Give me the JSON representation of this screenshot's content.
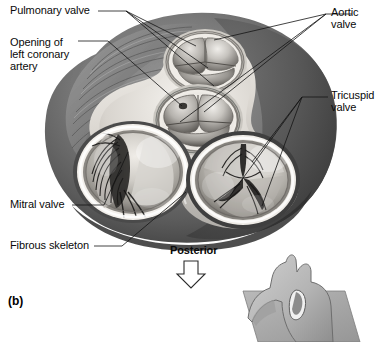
{
  "figure": {
    "panel_letter": "(b)",
    "view_description": "Superior view of the heart valves and fibrous skeleton with atria removed"
  },
  "labels": {
    "pulmonary_valve": "Pulmonary valve",
    "opening_left_coronary_line1": "Opening of",
    "opening_left_coronary_line2": "left coronary",
    "opening_left_coronary_line3": "artery",
    "aortic_valve_line1": "Aortic",
    "aortic_valve_line2": "valve",
    "tricuspid_valve_line1": "Tricuspid",
    "tricuspid_valve_line2": "valve",
    "mitral_valve": "Mitral valve",
    "fibrous_skeleton": "Fibrous skeleton",
    "posterior": "Posterior"
  },
  "structures": {
    "pulmonary_valve": {
      "name": "Pulmonary valve",
      "cusp_count": 3,
      "position": "superior-center"
    },
    "aortic_valve": {
      "name": "Aortic valve",
      "cusp_count": 3,
      "position": "center"
    },
    "mitral_valve": {
      "name": "Mitral valve",
      "cusp_count": 2,
      "alias": "bicuspid valve",
      "position": "left-inferior"
    },
    "tricuspid_valve": {
      "name": "Tricuspid valve",
      "cusp_count": 3,
      "position": "right-inferior"
    },
    "fibrous_skeleton": {
      "name": "Fibrous skeleton",
      "position": "between-valve-rings"
    },
    "left_coronary_opening": {
      "name": "Opening of left coronary artery",
      "position": "aortic-sinus"
    }
  },
  "orientation": {
    "direction_label": "Posterior",
    "arrow": "down-arrow-outline"
  },
  "inset": {
    "name": "heart-orientation-inset",
    "description": "Small anterior view of the heart with sectional plane"
  },
  "colors": {
    "background": "#ffffff",
    "text": "#0a0a0a",
    "leader_line": "#1a1a1a",
    "myocardium_dark": "#5f5f5f",
    "myocardium_mid": "#8d8d8d",
    "fibrous_light": "#e8e6e2",
    "valve_cusp": "#b9b6b2",
    "inset_plane": "#a9a9a9",
    "inset_heart": "#bdbdbd"
  }
}
